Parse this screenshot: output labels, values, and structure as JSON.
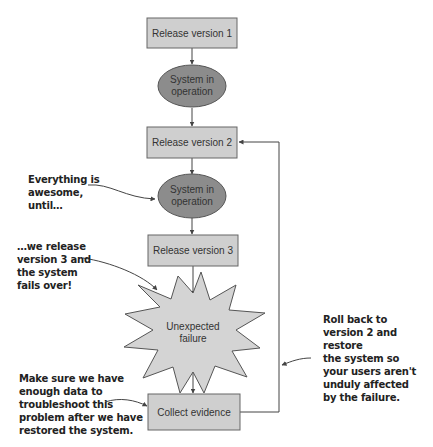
{
  "diagram": {
    "colors": {
      "box_fill": "#cfcfcf",
      "box_stroke": "#666666",
      "ellipse_fill": "#8c8c8c",
      "ellipse_stroke": "#555555",
      "burst_fill": "#d4d4d4",
      "line": "#444444"
    },
    "nodes": [
      {
        "id": "release-1",
        "shape": "rect",
        "label": "Release version 1"
      },
      {
        "id": "operation-1",
        "shape": "ellipse",
        "label_line1": "System in",
        "label_line2": "operation"
      },
      {
        "id": "release-2",
        "shape": "rect",
        "label": "Release version 2"
      },
      {
        "id": "operation-2",
        "shape": "ellipse",
        "label_line1": "System in",
        "label_line2": "operation"
      },
      {
        "id": "release-3",
        "shape": "rect",
        "label": "Release version 3"
      },
      {
        "id": "failure",
        "shape": "starburst",
        "label_line1": "Unexpected",
        "label_line2": "failure"
      },
      {
        "id": "collect",
        "shape": "rect",
        "label": "Collect evidence"
      }
    ],
    "edges": [
      {
        "from": "release-1",
        "to": "operation-1"
      },
      {
        "from": "operation-1",
        "to": "release-2"
      },
      {
        "from": "release-2",
        "to": "operation-2"
      },
      {
        "from": "operation-2",
        "to": "release-3"
      },
      {
        "from": "release-3",
        "to": "failure"
      },
      {
        "from": "failure",
        "to": "collect"
      },
      {
        "from": "collect",
        "to": "release-2",
        "type": "feedback"
      }
    ],
    "annotations": {
      "awesome": "Everything is\nawesome,\nuntil…",
      "release3": "…we release\nversion 3 and\nthe system\nfails over!",
      "collect": "Make sure we have\nenough data to\ntroubleshoot this\nproblem after we have\nrestored the system.",
      "rollback": "Roll back to\nversion 2 and restore\nthe system so\nyour users aren't\nunduly affected\nby the failure."
    }
  }
}
